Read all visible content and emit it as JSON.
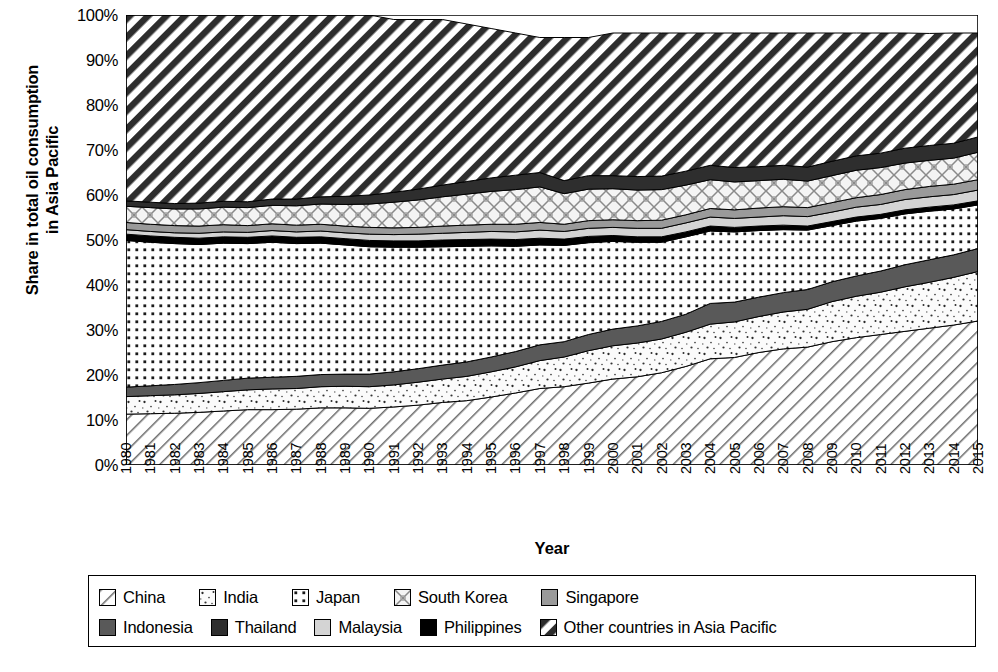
{
  "chart_data": {
    "type": "area",
    "stacked": true,
    "title": "",
    "xlabel": "Year",
    "ylabel": "Share in total oil consumption in Asia Pacific",
    "ylabel_line1": "Share in total oil consumption",
    "ylabel_line2": "in Asia Pacific",
    "ylim": [
      0,
      100
    ],
    "yticks": [
      "0%",
      "10%",
      "20%",
      "30%",
      "40%",
      "50%",
      "60%",
      "70%",
      "80%",
      "90%",
      "100%"
    ],
    "grid": false,
    "legend_position": "bottom",
    "units": "percent",
    "categories": [
      "1980",
      "1981",
      "1982",
      "1983",
      "1984",
      "1985",
      "1986",
      "1987",
      "1988",
      "1989",
      "1990",
      "1991",
      "1992",
      "1993",
      "1994",
      "1995",
      "1996",
      "1997",
      "1998",
      "1999",
      "2000",
      "2001",
      "2002",
      "2003",
      "2004",
      "2005",
      "2006",
      "2007",
      "2008",
      "2009",
      "2010",
      "2011",
      "2012",
      "2013",
      "2014",
      "2015"
    ],
    "series": [
      {
        "name": "China",
        "pattern": "diagonal-hatch-light",
        "color": "#ffffff",
        "values": [
          11.3,
          11.4,
          11.5,
          11.7,
          12.0,
          12.3,
          12.3,
          12.4,
          12.7,
          12.7,
          12.6,
          12.9,
          13.3,
          13.9,
          14.3,
          15.1,
          16.0,
          17.0,
          17.4,
          18.2,
          19.1,
          19.6,
          20.5,
          21.9,
          23.6,
          23.9,
          25.0,
          25.8,
          26.2,
          27.4,
          28.3,
          29.0,
          29.7,
          30.4,
          31.1,
          32.0
        ]
      },
      {
        "name": "India",
        "pattern": "sparse-speckle",
        "color": "#fafafa",
        "values": [
          3.9,
          4.0,
          4.1,
          4.2,
          4.3,
          4.4,
          4.6,
          4.6,
          4.7,
          4.8,
          4.8,
          4.9,
          5.1,
          5.2,
          5.4,
          5.6,
          5.8,
          6.2,
          6.6,
          7.2,
          7.4,
          7.5,
          7.5,
          7.6,
          7.7,
          7.9,
          8.0,
          8.2,
          8.4,
          8.9,
          9.2,
          9.4,
          9.9,
          10.2,
          10.6,
          11.0
        ]
      },
      {
        "name": "Indonesia",
        "pattern": "solid-dark-gray",
        "color": "#595959",
        "values": [
          2.1,
          2.2,
          2.3,
          2.4,
          2.5,
          2.6,
          2.6,
          2.7,
          2.7,
          2.7,
          2.8,
          2.9,
          3.0,
          3.1,
          3.2,
          3.3,
          3.4,
          3.5,
          3.4,
          3.6,
          3.7,
          3.8,
          3.9,
          4.0,
          4.6,
          4.4,
          4.3,
          4.3,
          4.4,
          4.4,
          4.5,
          4.7,
          4.9,
          5.0,
          5.0,
          5.1
        ]
      },
      {
        "name": "Japan",
        "pattern": "square-dot-grid",
        "color": "#ffffff",
        "values": [
          32.6,
          31.9,
          31.3,
          30.7,
          30.5,
          29.9,
          30.0,
          29.5,
          29.2,
          28.7,
          28.3,
          27.7,
          27.0,
          26.3,
          25.7,
          24.7,
          23.4,
          22.2,
          21.4,
          20.4,
          19.5,
          18.6,
          17.6,
          17.2,
          16.1,
          15.6,
          14.8,
          14.0,
          13.2,
          12.5,
          12.2,
          11.7,
          11.3,
          10.8,
          10.2,
          9.7
        ]
      },
      {
        "name": "Philippines",
        "pattern": "solid-black",
        "color": "#000000",
        "values": [
          1.4,
          1.4,
          1.4,
          1.4,
          1.4,
          1.4,
          1.4,
          1.4,
          1.4,
          1.4,
          1.4,
          1.4,
          1.4,
          1.5,
          1.5,
          1.5,
          1.5,
          1.5,
          1.4,
          1.4,
          1.3,
          1.2,
          1.2,
          1.1,
          1.1,
          1.0,
          1.0,
          1.0,
          0.9,
          0.9,
          0.9,
          0.9,
          0.9,
          0.9,
          0.9,
          0.9
        ]
      },
      {
        "name": "Malaysia",
        "pattern": "light-gray",
        "color": "#d4d4d4",
        "values": [
          1.0,
          1.0,
          1.0,
          1.1,
          1.1,
          1.1,
          1.2,
          1.2,
          1.3,
          1.3,
          1.4,
          1.4,
          1.5,
          1.5,
          1.6,
          1.7,
          1.7,
          1.8,
          1.7,
          1.8,
          1.8,
          1.9,
          1.9,
          2.0,
          2.0,
          2.0,
          2.0,
          2.1,
          2.1,
          2.1,
          2.2,
          2.2,
          2.3,
          2.3,
          2.3,
          2.4
        ]
      },
      {
        "name": "Singapore",
        "pattern": "medium-gray",
        "color": "#9a9a9a",
        "values": [
          1.6,
          1.6,
          1.6,
          1.6,
          1.6,
          1.5,
          1.5,
          1.5,
          1.5,
          1.5,
          1.5,
          1.5,
          1.5,
          1.6,
          1.6,
          1.6,
          1.7,
          1.7,
          1.6,
          1.7,
          1.7,
          1.7,
          1.8,
          1.8,
          1.9,
          1.9,
          2.0,
          2.0,
          2.0,
          2.1,
          2.1,
          2.2,
          2.2,
          2.3,
          2.3,
          2.3
        ]
      },
      {
        "name": "South Korea",
        "pattern": "cross-diamond-hatch",
        "color": "#f2f2f2",
        "values": [
          3.6,
          3.7,
          3.7,
          3.8,
          3.9,
          4.0,
          4.1,
          4.3,
          4.5,
          4.8,
          5.2,
          5.7,
          6.1,
          6.5,
          6.9,
          7.3,
          7.7,
          7.9,
          6.8,
          7.0,
          6.9,
          6.8,
          6.8,
          6.6,
          6.4,
          6.2,
          6.1,
          6.1,
          5.9,
          6.0,
          6.1,
          6.0,
          5.9,
          5.8,
          5.8,
          6.1
        ]
      },
      {
        "name": "Thailand",
        "pattern": "very-dark-gray",
        "color": "#2e2e2e",
        "values": [
          1.2,
          1.2,
          1.2,
          1.3,
          1.3,
          1.3,
          1.4,
          1.5,
          1.6,
          1.8,
          2.0,
          2.2,
          2.4,
          2.6,
          2.8,
          3.0,
          3.2,
          3.2,
          2.9,
          3.0,
          2.9,
          3.0,
          3.0,
          3.1,
          3.2,
          3.2,
          3.1,
          3.1,
          3.1,
          3.2,
          3.2,
          3.2,
          3.3,
          3.3,
          3.3,
          3.4
        ]
      },
      {
        "name": "Other countries in Asia Pacific",
        "pattern": "diagonal-hatch-bold",
        "color": "#ffffff",
        "values": [
          41.3,
          41.6,
          41.9,
          41.8,
          41.4,
          41.5,
          40.9,
          40.9,
          40.4,
          40.3,
          40.0,
          38.4,
          37.7,
          36.8,
          35.0,
          33.2,
          31.6,
          30.0,
          31.8,
          30.7,
          31.7,
          31.9,
          31.8,
          30.7,
          29.4,
          29.9,
          29.7,
          29.4,
          29.8,
          28.5,
          27.3,
          26.7,
          25.6,
          24.9,
          24.5,
          23.1
        ]
      }
    ]
  },
  "legend": {
    "rows": [
      [
        {
          "label": "China",
          "swatch": "diagonal-hatch-light"
        },
        {
          "label": "India",
          "swatch": "sparse-speckle"
        },
        {
          "label": "Japan",
          "swatch": "square-dot-grid"
        },
        {
          "label": "South Korea",
          "swatch": "cross-diamond-hatch"
        },
        {
          "label": "Singapore",
          "swatch": "medium-gray"
        }
      ],
      [
        {
          "label": "Indonesia",
          "swatch": "solid-dark-gray"
        },
        {
          "label": "Thailand",
          "swatch": "very-dark-gray"
        },
        {
          "label": "Malaysia",
          "swatch": "light-gray"
        },
        {
          "label": "Philippines",
          "swatch": "solid-black"
        },
        {
          "label": "Other countries in Asia Pacific",
          "swatch": "diagonal-hatch-bold"
        }
      ]
    ]
  }
}
